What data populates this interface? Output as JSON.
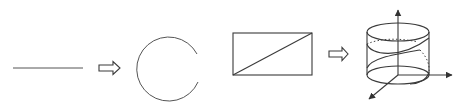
{
  "diagram": {
    "steps": [
      {
        "id": "segment",
        "label": "line segment"
      },
      {
        "id": "arrow-1",
        "label": "transforms into"
      },
      {
        "id": "circle",
        "label": "open circle"
      },
      {
        "id": "rectangle",
        "label": "rectangle with diagonal"
      },
      {
        "id": "arrow-2",
        "label": "transforms into"
      },
      {
        "id": "cylinder",
        "label": "cylinder with helix and coordinate axes"
      }
    ],
    "colors": {
      "stroke": "#3a3a3a",
      "background": "#ffffff"
    }
  }
}
